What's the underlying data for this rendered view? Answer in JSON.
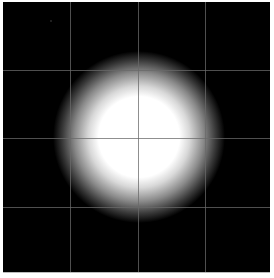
{
  "image": {
    "description": "Bright white circular glow centered on black background with a 4x4 grid overlay",
    "background_color": "#000000",
    "border_color": "#ffffff",
    "frame": {
      "left": 3,
      "top": 2,
      "width": 267,
      "height": 270
    },
    "glow": {
      "center_x": 136,
      "center_y": 135,
      "inner_radius": 40,
      "outer_radius": 86,
      "core_color": "#ffffff",
      "edge_color": "#000000"
    },
    "grid": {
      "color": "#6a6a6a",
      "opacity": 0.75,
      "vertical_lines_x": [
        67,
        135,
        202
      ],
      "horizontal_lines_y": [
        68,
        136,
        205
      ]
    },
    "speck": {
      "x": 47,
      "y": 18,
      "color": "#2a2a2a"
    }
  }
}
